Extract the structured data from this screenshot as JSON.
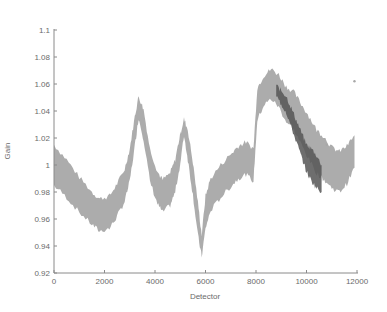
{
  "chart_data": {
    "type": "scatter",
    "title": "",
    "xlabel": "Detector",
    "ylabel": "Gain",
    "xlim": [
      0,
      12000
    ],
    "ylim": [
      0.92,
      1.1
    ],
    "xticks": [
      0,
      2000,
      4000,
      6000,
      8000,
      10000,
      12000
    ],
    "xtick_labels": [
      "0",
      "2000",
      "4000",
      "6000",
      "8000",
      "10000",
      "12000"
    ],
    "yticks": [
      0.92,
      0.94,
      0.96,
      0.98,
      1.0,
      1.02,
      1.04,
      1.06,
      1.08,
      1.1
    ],
    "ytick_labels": [
      "0.92",
      "0.94",
      "0.96",
      "0.98",
      "1",
      "1.02",
      "1.04",
      "1.06",
      "1.08",
      "1.1"
    ],
    "grid": false,
    "legend": null,
    "series": [
      {
        "name": "gain (light gray)",
        "color": "#a8a8a8",
        "x": [
          0,
          500,
          1000,
          1500,
          1800,
          2200,
          2500,
          2800,
          3000,
          3200,
          3350,
          3550,
          3800,
          4100,
          4300,
          4600,
          4800,
          5000,
          5150,
          5300,
          5500,
          5700,
          5850,
          6000,
          6200,
          6600,
          7000,
          7300,
          7600,
          7900,
          8050,
          8300,
          8600,
          8900,
          9200,
          9500,
          9800,
          10100,
          10400,
          10700,
          11000,
          11300,
          11600,
          11900
        ],
        "center": [
          1.0,
          0.99,
          0.978,
          0.968,
          0.963,
          0.965,
          0.974,
          0.985,
          1.0,
          1.025,
          1.043,
          1.03,
          1.0,
          0.983,
          0.977,
          0.982,
          0.992,
          1.012,
          1.028,
          1.015,
          0.99,
          0.96,
          0.94,
          0.965,
          0.978,
          0.988,
          0.996,
          1.002,
          1.005,
          1.0,
          1.045,
          1.055,
          1.06,
          1.055,
          1.045,
          1.04,
          1.03,
          1.02,
          1.01,
          1.005,
          0.998,
          0.995,
          1.0,
          1.01
        ],
        "half_width": [
          0.015,
          0.014,
          0.013,
          0.012,
          0.012,
          0.012,
          0.012,
          0.012,
          0.012,
          0.011,
          0.008,
          0.011,
          0.012,
          0.012,
          0.012,
          0.012,
          0.012,
          0.011,
          0.006,
          0.011,
          0.012,
          0.012,
          0.008,
          0.012,
          0.012,
          0.012,
          0.012,
          0.012,
          0.012,
          0.012,
          0.012,
          0.011,
          0.011,
          0.012,
          0.013,
          0.014,
          0.015,
          0.016,
          0.016,
          0.016,
          0.015,
          0.015,
          0.014,
          0.012
        ]
      },
      {
        "name": "gain (dark gray subset)",
        "color": "#555555",
        "x": [
          8800,
          9000,
          9200,
          9400,
          9600,
          9800,
          10000,
          10200,
          10400,
          10600
        ],
        "center": [
          1.055,
          1.05,
          1.045,
          1.035,
          1.025,
          1.015,
          1.005,
          1.0,
          0.995,
          0.99
        ],
        "half_width": [
          0.004,
          0.005,
          0.006,
          0.007,
          0.008,
          0.009,
          0.01,
          0.012,
          0.012,
          0.01
        ]
      }
    ],
    "outliers": [
      {
        "x": 11900,
        "y": 1.062
      },
      {
        "x": 10800,
        "y": 1.015
      }
    ]
  },
  "style": {
    "band_color": "#a8a8a8",
    "dark_color": "#555555",
    "axis_color": "#8a8a8a",
    "text_color": "#6a6a6a"
  }
}
